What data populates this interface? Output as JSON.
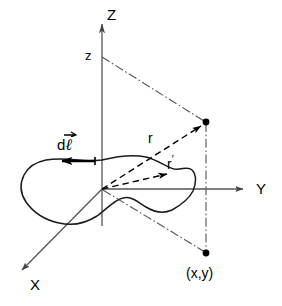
{
  "diagram": {
    "background_color": "#ffffff",
    "line_color": "#000000",
    "axis_color": "#4d4d4d",
    "width": 282,
    "height": 306,
    "labels": {
      "z_axis": "Z",
      "y_axis": "Y",
      "x_axis": "X",
      "z_height": "z",
      "r_vector": "r",
      "r_prime_vector": "r",
      "r_prime_mark": "′",
      "dl_d": "d",
      "dl_ell": "ℓ",
      "field_point": "(x,y)"
    },
    "elements": {
      "loop": "closed-irregular-current-loop",
      "dl_arrow_direction": "left",
      "r_arrow_target": "upper-field-point",
      "r_prime_arrow_target": "loop-source-point",
      "projection_line_style": "dash-dot",
      "vector_line_style": "dashed"
    },
    "points": {
      "origin": {
        "x": 102,
        "y": 189
      },
      "field_point_3d": {
        "x": 206,
        "y": 122
      },
      "field_point_xy": {
        "x": 206,
        "y": 253
      },
      "z_mark": {
        "x": 102,
        "y": 57
      },
      "source_point": {
        "x": 172,
        "y": 172
      }
    }
  }
}
